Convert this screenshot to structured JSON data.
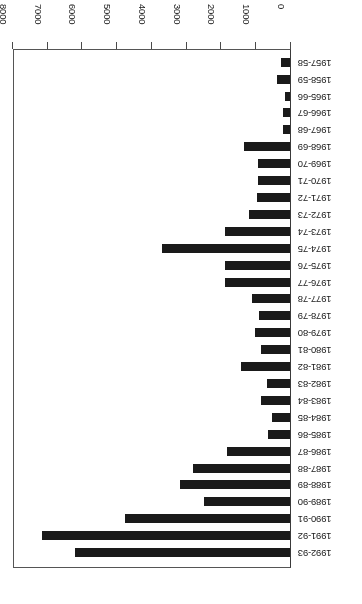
{
  "chart_data": {
    "type": "bar",
    "orientation": "horizontal",
    "title": "",
    "subtitle": "",
    "xlabel": "",
    "ylabel": "",
    "xlim": [
      0,
      8000
    ],
    "xticks": [
      0,
      1000,
      2000,
      3000,
      4000,
      5000,
      6000,
      7000,
      8000
    ],
    "xtick_labels": [
      "0",
      "1000",
      "2000",
      "3000",
      "4000",
      "5000",
      "6000",
      "7000",
      "8000"
    ],
    "grid": false,
    "legend": false,
    "legend_position": "none",
    "bar_color": "#1a1a1a",
    "axis_color": "#4a4a4a",
    "rotation_note": "figure rendered rotated 180 degrees",
    "categories": [
      "1957-58",
      "1958-59",
      "1965-66",
      "1966-67",
      "1967-68",
      "1968-69",
      "1969-70",
      "1970-71",
      "1971-72",
      "1972-73",
      "1973-74",
      "1974-75",
      "1975-76",
      "1976-77",
      "1977-78",
      "1978-79",
      "1979-80",
      "1980-81",
      "1981-82",
      "1982-83",
      "1983-84",
      "1984-85",
      "1985-86",
      "1986-87",
      "1987-88",
      "1988-89",
      "1989-90",
      "1990-91",
      "1991-92",
      "1992-93"
    ],
    "values": [
      255,
      365,
      140,
      195,
      195,
      1320,
      925,
      925,
      955,
      1180,
      1860,
      3680,
      1860,
      1860,
      1100,
      900,
      1010,
      840,
      1400,
      675,
      840,
      505,
      645,
      1800,
      2780,
      3175,
      2470,
      4750,
      7135,
      6180
    ]
  }
}
